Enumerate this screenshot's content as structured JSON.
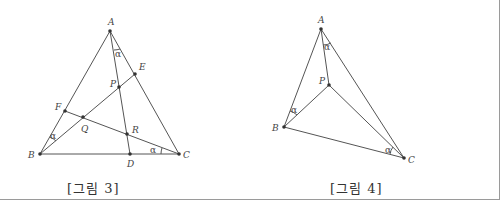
{
  "figures": [
    {
      "caption": "[그림 3]",
      "points": {
        "A": {
          "label": "A",
          "x": 110,
          "y": 31
        },
        "B": {
          "label": "B",
          "x": 40,
          "y": 154
        },
        "C": {
          "label": "C",
          "x": 179,
          "y": 154
        },
        "D": {
          "label": "D",
          "x": 130,
          "y": 154
        },
        "E": {
          "label": "E",
          "x": 135,
          "y": 74
        },
        "F": {
          "label": "F",
          "x": 65,
          "y": 111
        },
        "P": {
          "label": "P",
          "x": 119,
          "y": 87
        },
        "Q": {
          "label": "Q",
          "x": 83,
          "y": 117
        },
        "R": {
          "label": "R",
          "x": 127,
          "y": 134
        }
      },
      "angle_label": "α"
    },
    {
      "caption": "[그림 4]",
      "points": {
        "A": {
          "label": "A",
          "x": 321,
          "y": 29
        },
        "B": {
          "label": "B",
          "x": 284,
          "y": 127
        },
        "C": {
          "label": "C",
          "x": 404,
          "y": 158
        },
        "P": {
          "label": "P",
          "x": 329,
          "y": 85
        }
      },
      "angle_label": "α"
    }
  ],
  "colors": {
    "line": "#555555",
    "point": "#333333",
    "frame": "#9a9a9a"
  }
}
